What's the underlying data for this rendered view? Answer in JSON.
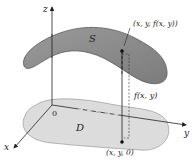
{
  "diagram": {
    "type": "3d-surface-over-region",
    "axes": {
      "x_label": "x",
      "y_label": "y",
      "z_label": "z",
      "origin_label": "0"
    },
    "surface": {
      "label": "S",
      "color": "#8a8a8a"
    },
    "region": {
      "label": "D",
      "color": "#d9d9d9"
    },
    "points": {
      "top_point_label": "(x, y, f(x, y))",
      "bottom_point_label": "(x, y, 0)"
    },
    "height_label": "f(x, y)"
  }
}
